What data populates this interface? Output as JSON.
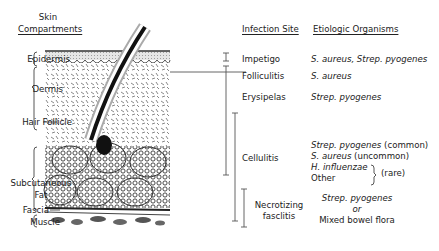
{
  "compartments": {
    "header_line1": "Skin",
    "header_line2": "Compartments",
    "items": [
      {
        "label": "Epidermis"
      },
      {
        "label": "Dermis"
      },
      {
        "label": "Hair Follicle"
      },
      {
        "label_line1": "Subcutaneous",
        "label_line2": "Fat"
      },
      {
        "label": "Fascia"
      },
      {
        "label": "Muscle"
      }
    ]
  },
  "infection_site": {
    "header": "Infection Site",
    "items": [
      {
        "label": "Impetigo"
      },
      {
        "label": "Folliculitis"
      },
      {
        "label": "Erysipelas"
      },
      {
        "label": "Cellulitis"
      },
      {
        "label_line1": "Necrotizing",
        "label_line2": "fasclitis"
      }
    ]
  },
  "etiologic_organisms": {
    "header": "Etiologic Organisms",
    "impetigo": "S. aureus, Strep. pyogenes",
    "folliculitis": "S. aureus",
    "erysipelas": "Strep. pyogenes",
    "cellulitis": {
      "line1_italic": "Strep. pyogenes",
      "line1_plain": " (common)",
      "line2_italic": "S. aureus",
      "line2_plain": " (uncommon)",
      "line3_italic": "H. influenzae",
      "line4": "Other",
      "rare_note": "(rare)"
    },
    "necrotizing": {
      "line1": "Strep. pyogenes",
      "line2": "or",
      "line3": "Mixed bowel flora"
    }
  }
}
